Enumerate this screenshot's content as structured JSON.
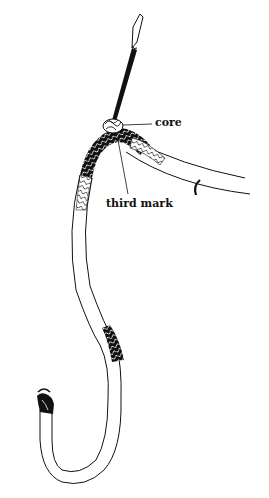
{
  "diagram": {
    "labels": {
      "core": "core",
      "third_mark": "third mark"
    },
    "colors": {
      "ink": "#111111",
      "background": "#ffffff"
    },
    "parts": [
      "fid",
      "core",
      "braided-section-top",
      "third-mark",
      "rope-tail",
      "braided-section-middle",
      "rope-loop",
      "whipped-end"
    ]
  }
}
